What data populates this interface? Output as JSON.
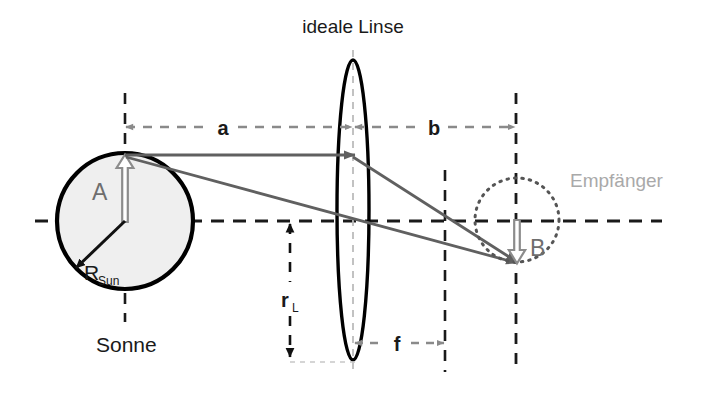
{
  "figure": {
    "domain": "diagram",
    "kind": "optical-ray-diagram",
    "language": "de",
    "background_color": "#ffffff",
    "width": 708,
    "height": 415
  },
  "labels": {
    "lens_title": "ideale Linse",
    "sun_label": "Sonne",
    "receiver_label": "Empfänger",
    "sun_amplitude": "A",
    "image_amplitude": "B",
    "sun_radius": "R",
    "sun_radius_sub": "Sun",
    "lens_radius": "r",
    "lens_radius_sub": "L",
    "dist_object": "a",
    "dist_image": "b",
    "focal_length": "f"
  },
  "colors": {
    "axis": "#1a1a1a",
    "outline": "#000000",
    "sun_fill": "#efefef",
    "ray": "#606060",
    "dim_gray": "#8a8a8a",
    "receiver_dotted": "#555555",
    "receiver_text": "#a9a9a9",
    "amplitude_arrow": "#8c8c8c"
  },
  "geometry": {
    "optical_axis_y": 221,
    "optical_axis_x_start": 35,
    "optical_axis_x_end": 662,
    "sun": {
      "cx": 125,
      "cy": 221,
      "r": 68,
      "top_y": 155,
      "bottom_y": 289
    },
    "lens": {
      "cx": 353,
      "cy": 210,
      "rx": 16,
      "ry": 150,
      "top_y": 60,
      "bottom_y": 360
    },
    "focal_plane_x": 445,
    "image_plane_x": 516,
    "object_plane_x": 125,
    "receiver": {
      "cx": 517,
      "cy": 220,
      "r": 42
    },
    "image_point": {
      "x": 517,
      "y": 262
    },
    "dimension_row_y": 127,
    "focal_row_y": 343,
    "rl_x": 290,
    "rl_top_y": 222,
    "rl_bottom_y": 358
  },
  "elements": {
    "rays": [
      {
        "name": "parallel-ray",
        "from": [
          125,
          155
        ],
        "via": [
          353,
          155
        ],
        "to": [
          517,
          262
        ]
      },
      {
        "name": "chief-ray",
        "from": [
          125,
          155
        ],
        "to": [
          517,
          262
        ]
      }
    ],
    "dimensions": [
      {
        "name": "a",
        "from_x": 125,
        "to_x": 353,
        "y": 127
      },
      {
        "name": "b",
        "from_x": 353,
        "to_x": 516,
        "y": 127
      },
      {
        "name": "f",
        "from_x": 353,
        "to_x": 445,
        "y": 343
      },
      {
        "name": "rL",
        "x": 290,
        "from_y": 222,
        "to_y": 358
      }
    ]
  }
}
